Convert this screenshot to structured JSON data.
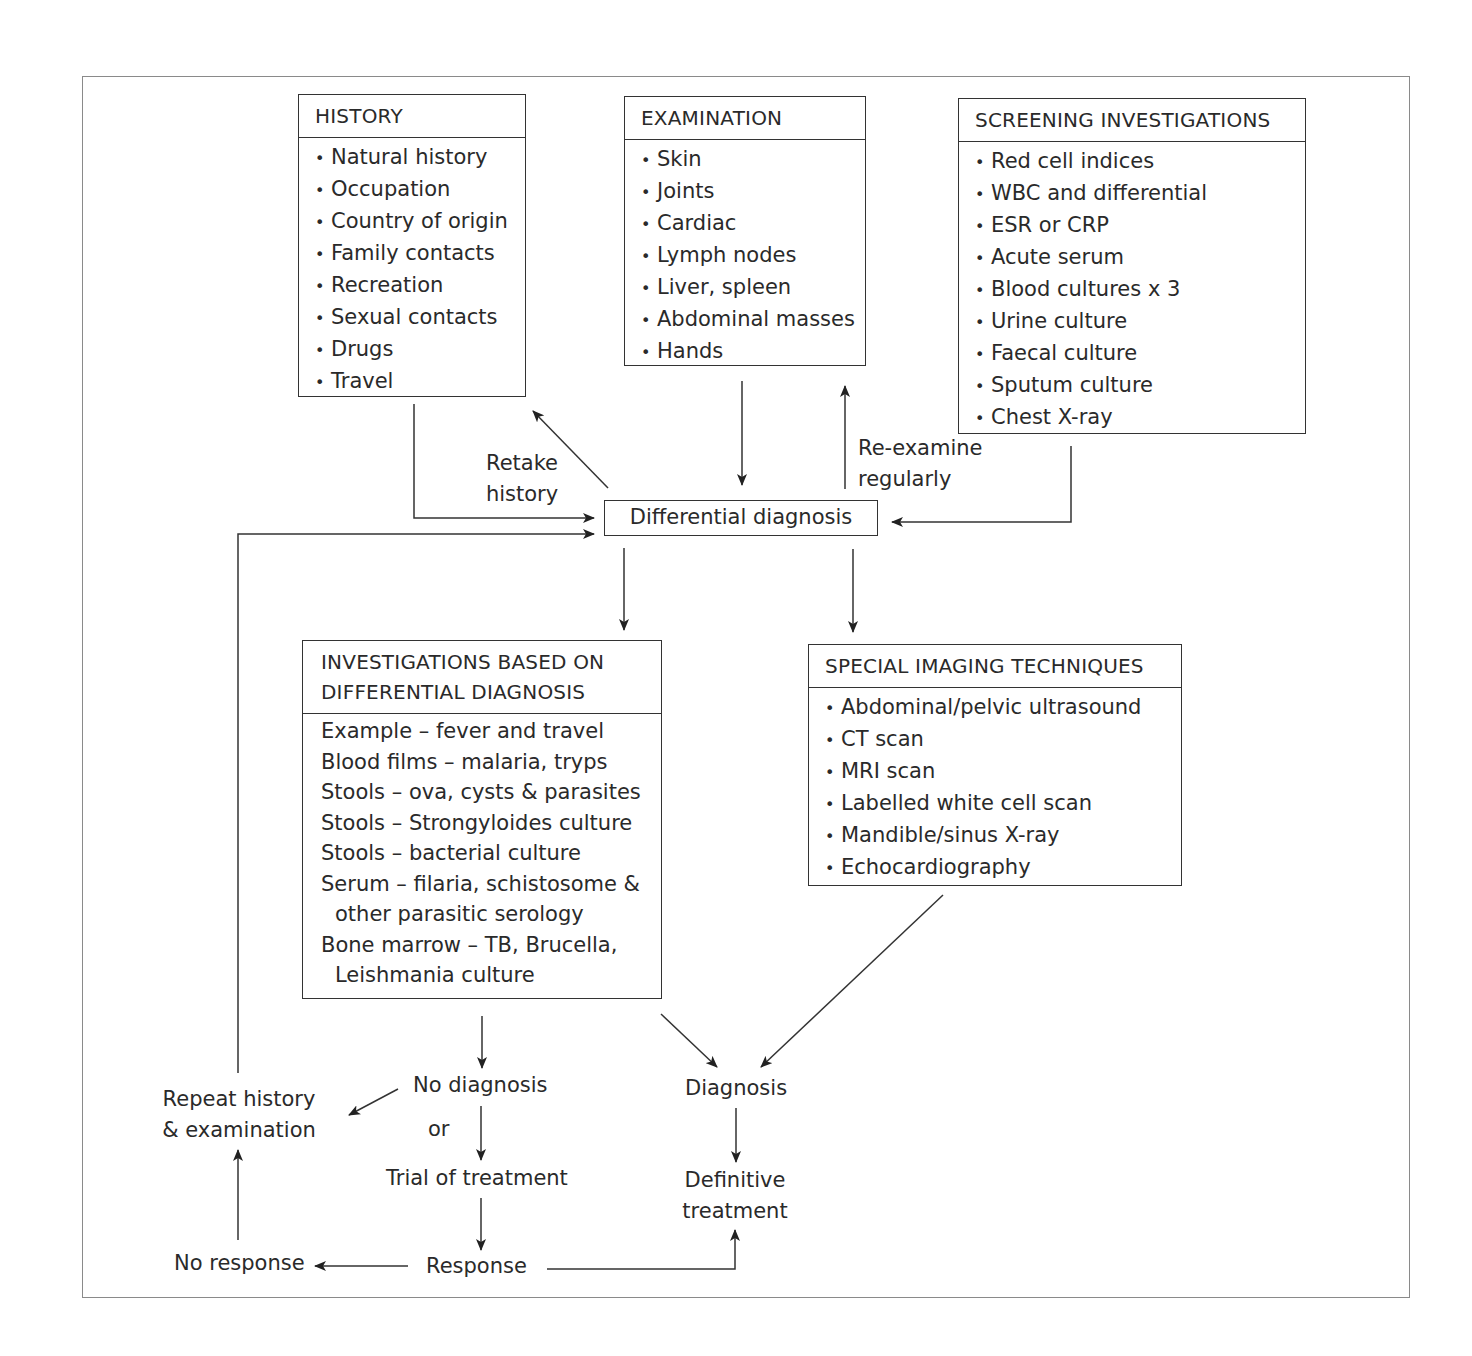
{
  "diagram": {
    "boxes": {
      "history": {
        "title": "HISTORY",
        "items": [
          "Natural history",
          "Occupation",
          "Country of origin",
          "Family contacts",
          "Recreation",
          "Sexual contacts",
          "Drugs",
          "Travel"
        ]
      },
      "examination": {
        "title": "EXAMINATION",
        "items": [
          "Skin",
          "Joints",
          "Cardiac",
          "Lymph nodes",
          "Liver, spleen",
          "Abdominal masses",
          "Hands"
        ]
      },
      "screening": {
        "title": "SCREENING INVESTIGATIONS",
        "items": [
          "Red cell indices",
          "WBC and differential",
          "ESR or CRP",
          "Acute serum",
          "Blood cultures x 3",
          "Urine culture",
          "Faecal culture",
          "Sputum culture",
          "Chest X-ray"
        ]
      },
      "differential": {
        "title": "Differential diagnosis"
      },
      "investigations": {
        "title_line1": "INVESTIGATIONS BASED ON",
        "title_line2": "DIFFERENTIAL DIAGNOSIS",
        "lines": [
          "Example – fever and travel",
          "Blood films – malaria, tryps",
          "Stools – ova, cysts & parasites",
          "Stools – Strongyloides culture",
          "Stools – bacterial culture",
          "Serum – filaria, schistosome &",
          "other parasitic serology",
          "Bone marrow – TB, Brucella,",
          "Leishmania culture"
        ]
      },
      "imaging": {
        "title": "SPECIAL IMAGING TECHNIQUES",
        "items": [
          "Abdominal/pelvic ultrasound",
          "CT scan",
          "MRI scan",
          "Labelled white cell scan",
          "Mandible/sinus X-ray",
          "Echocardiography"
        ]
      }
    },
    "labels": {
      "retake_1": "Retake",
      "retake_2": "history",
      "reexamine_1": "Re-examine",
      "reexamine_2": "regularly",
      "no_diagnosis": "No diagnosis",
      "or": "or",
      "trial": "Trial of treatment",
      "response": "Response",
      "no_response": "No response",
      "repeat_1": "Repeat history",
      "repeat_2": "& examination",
      "diagnosis": "Diagnosis",
      "definitive_1": "Definitive",
      "definitive_2": "treatment"
    },
    "bullet": "•"
  }
}
